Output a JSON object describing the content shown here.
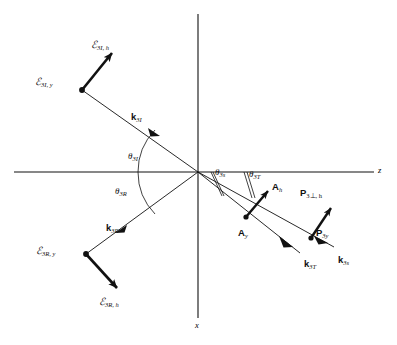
{
  "figure": {
    "background": "#ffffff",
    "line_color": "#111111",
    "axes": {
      "horizontal_label": "z",
      "vertical_label": "x",
      "origin": {
        "x": 198,
        "y": 172
      }
    },
    "angles": [
      {
        "name": "theta-3I",
        "label_base": "θ",
        "sub": "3I",
        "x": 128,
        "y": 152
      },
      {
        "name": "theta-3R",
        "label_base": "θ",
        "sub": "3R",
        "x": 115,
        "y": 187
      },
      {
        "name": "theta-3s",
        "label_base": "θ",
        "sub": "3s",
        "x": 215,
        "y": 168
      },
      {
        "name": "theta-3T",
        "label_base": "θ",
        "sub": "3T",
        "x": 249,
        "y": 170
      }
    ],
    "vectors": [
      {
        "name": "k-3I",
        "base": "k",
        "sub": "3I",
        "x": 131,
        "y": 112
      },
      {
        "name": "k-3R",
        "base": "k",
        "sub": "3R",
        "x": 106,
        "y": 223
      },
      {
        "name": "k-3T",
        "base": "k",
        "sub": "3T",
        "x": 304,
        "y": 259
      },
      {
        "name": "k-3s",
        "base": "k",
        "sub": "3s",
        "x": 338,
        "y": 255
      }
    ],
    "fields": [
      {
        "name": "E-3I-h",
        "base": "ℰ",
        "sub": "3I, h",
        "x": 91,
        "y": 40
      },
      {
        "name": "E-3I-y",
        "base": "ℰ",
        "sub": "3I, y",
        "x": 35,
        "y": 77
      },
      {
        "name": "E-3R-y",
        "base": "ℰ",
        "sub": "3R, y",
        "x": 36,
        "y": 246
      },
      {
        "name": "E-3R-h",
        "base": "ℰ",
        "sub": "3R, h",
        "x": 99,
        "y": 297
      }
    ],
    "amplitudes": [
      {
        "name": "A-h",
        "base": "A",
        "sub": "h",
        "x": 276,
        "y": 187
      },
      {
        "name": "A-y",
        "base": "A",
        "sub": "y",
        "x": 252,
        "y": 233
      },
      {
        "name": "P-3perp-h",
        "base": "P",
        "sub": "3⊥, h",
        "x": 302,
        "y": 190
      },
      {
        "name": "P-3y",
        "base": "P",
        "sub": "3y",
        "x": 318,
        "y": 232
      }
    ]
  }
}
